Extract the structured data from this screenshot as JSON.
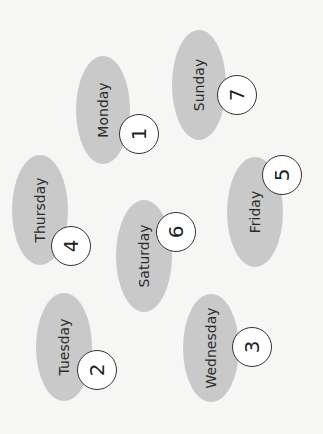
{
  "diagram": {
    "type": "day-number matching",
    "colors": {
      "background": "#f6f6f4",
      "oval": "#c9c9c9",
      "circle_fill": "#ffffff",
      "circle_border": "#333333",
      "text": "#2a2a2a"
    },
    "items": [
      {
        "day": "Monday",
        "number": "1",
        "oval": {
          "cx": 103,
          "cy": 110,
          "rx": 27,
          "ry": 54
        },
        "circle": {
          "cx": 139,
          "cy": 134,
          "r": 20
        }
      },
      {
        "day": "Sunday",
        "number": "7",
        "oval": {
          "cx": 199,
          "cy": 85,
          "rx": 27,
          "ry": 55
        },
        "circle": {
          "cx": 237,
          "cy": 95,
          "r": 20
        }
      },
      {
        "day": "Thursday",
        "number": "4",
        "oval": {
          "cx": 40,
          "cy": 210,
          "rx": 28,
          "ry": 55
        },
        "circle": {
          "cx": 71,
          "cy": 246,
          "r": 20
        }
      },
      {
        "day": "Saturday",
        "number": "6",
        "oval": {
          "cx": 144,
          "cy": 256,
          "rx": 28,
          "ry": 56
        },
        "circle": {
          "cx": 176,
          "cy": 232,
          "r": 20
        }
      },
      {
        "day": "Friday",
        "number": "5",
        "oval": {
          "cx": 255,
          "cy": 212,
          "rx": 28,
          "ry": 55
        },
        "circle": {
          "cx": 282,
          "cy": 175,
          "r": 20
        }
      },
      {
        "day": "Tuesday",
        "number": "2",
        "oval": {
          "cx": 64,
          "cy": 347,
          "rx": 28,
          "ry": 54
        },
        "circle": {
          "cx": 97,
          "cy": 370,
          "r": 20
        }
      },
      {
        "day": "Wednesday",
        "number": "3",
        "oval": {
          "cx": 211,
          "cy": 348,
          "rx": 28,
          "ry": 54
        },
        "circle": {
          "cx": 252,
          "cy": 347,
          "r": 20
        }
      }
    ]
  }
}
